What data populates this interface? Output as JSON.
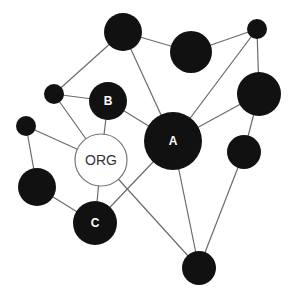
{
  "diagram": {
    "type": "network",
    "colors": {
      "node_dark": "#111111",
      "node_light": "#ffffff",
      "edge": "#6b6b6b",
      "label_on_dark": "#ffffff",
      "label_on_light": "#333333"
    },
    "nodes": [
      {
        "id": "n1",
        "label": "",
        "x": 123,
        "y": 32,
        "r": 19,
        "style": "dark"
      },
      {
        "id": "n2",
        "label": "",
        "x": 191,
        "y": 52,
        "r": 21,
        "style": "dark"
      },
      {
        "id": "n3",
        "label": "",
        "x": 257,
        "y": 29,
        "r": 10,
        "style": "dark"
      },
      {
        "id": "n4",
        "label": "",
        "x": 54,
        "y": 94,
        "r": 10,
        "style": "dark"
      },
      {
        "id": "B",
        "label": "B",
        "x": 108,
        "y": 101,
        "r": 19,
        "style": "dark"
      },
      {
        "id": "n5",
        "label": "",
        "x": 259,
        "y": 94,
        "r": 22,
        "style": "dark"
      },
      {
        "id": "n6",
        "label": "",
        "x": 26,
        "y": 126,
        "r": 10,
        "style": "dark"
      },
      {
        "id": "ORG",
        "label": "ORG",
        "x": 101,
        "y": 160,
        "r": 26,
        "style": "light"
      },
      {
        "id": "A",
        "label": "A",
        "x": 173,
        "y": 141,
        "r": 29,
        "style": "dark"
      },
      {
        "id": "n7",
        "label": "",
        "x": 244,
        "y": 152,
        "r": 17,
        "style": "dark"
      },
      {
        "id": "n8",
        "label": "",
        "x": 37,
        "y": 187,
        "r": 19,
        "style": "dark"
      },
      {
        "id": "C",
        "label": "C",
        "x": 95,
        "y": 223,
        "r": 22,
        "style": "dark"
      },
      {
        "id": "n9",
        "label": "",
        "x": 199,
        "y": 268,
        "r": 17,
        "style": "dark"
      }
    ],
    "edges": [
      [
        "n1",
        "n4"
      ],
      [
        "n1",
        "n2"
      ],
      [
        "n1",
        "A"
      ],
      [
        "n2",
        "n3"
      ],
      [
        "n3",
        "A"
      ],
      [
        "n3",
        "n5"
      ],
      [
        "n4",
        "B"
      ],
      [
        "n4",
        "ORG"
      ],
      [
        "B",
        "ORG"
      ],
      [
        "B",
        "A"
      ],
      [
        "n5",
        "A"
      ],
      [
        "n5",
        "n7"
      ],
      [
        "n6",
        "ORG"
      ],
      [
        "n6",
        "n8"
      ],
      [
        "ORG",
        "C"
      ],
      [
        "ORG",
        "n9"
      ],
      [
        "A",
        "C"
      ],
      [
        "A",
        "n9"
      ],
      [
        "n7",
        "n9"
      ],
      [
        "n8",
        "C"
      ]
    ]
  }
}
